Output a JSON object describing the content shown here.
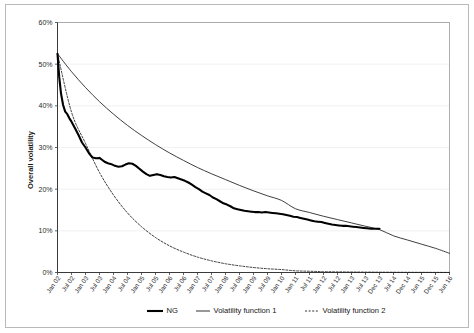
{
  "chart_data": {
    "type": "line",
    "title": "",
    "xlabel": "",
    "ylabel": "Overall volatility",
    "ylim": [
      0,
      60
    ],
    "yticks": [
      "0%",
      "10%",
      "20%",
      "30%",
      "40%",
      "50%",
      "60%"
    ],
    "ytick_values": [
      0,
      10,
      20,
      30,
      40,
      50,
      60
    ],
    "grid": true,
    "legend_position": "bottom",
    "categories": [
      "Jan 02",
      "Jul 02",
      "Jan 03",
      "Jul 03",
      "Jan 04",
      "Jul 04",
      "Jan 05",
      "Jul 05",
      "Jan 06",
      "Jul 06",
      "Jan 07",
      "Jul 07",
      "Jan 08",
      "Jul 08",
      "Jan 09",
      "Jul 09",
      "Jan 10",
      "Jan 11",
      "Jul 11",
      "Jan 12",
      "Jul 12",
      "Jan 13",
      "Jul 13",
      "Dec 13",
      "Jul 14",
      "Dec 14",
      "Jun 15",
      "Dec 15",
      "Jun 16"
    ],
    "series": [
      {
        "name": "NG",
        "style": "thick-solid",
        "color": "#000000",
        "values": [
          52.5,
          38.0,
          33.0,
          27.5,
          26.3,
          25.5,
          26.2,
          25.0,
          23.2,
          23.6,
          23.0,
          22.3,
          21.1,
          19.4,
          18.0,
          16.6,
          15.4,
          14.6,
          14.4,
          14.3,
          14.0,
          13.4,
          12.9,
          12.3,
          11.9,
          11.4,
          11.2,
          10.9,
          10.5
        ]
      },
      {
        "name": "Volatility function 1",
        "style": "thin-solid",
        "color": "#1c1c1c",
        "values": [
          52.5,
          48.2,
          44.4,
          41.0,
          38.0,
          35.3,
          32.9,
          30.7,
          28.7,
          26.9,
          25.2,
          23.7,
          22.3,
          20.9,
          19.6,
          18.4,
          17.3,
          15.3,
          14.4,
          13.5,
          12.7,
          11.9,
          11.1,
          10.3,
          8.8,
          7.8,
          6.8,
          5.8,
          4.6
        ]
      },
      {
        "name": "Volatility function 2",
        "style": "dotted",
        "color": "#1c1c1c",
        "values": [
          52.5,
          38.5,
          31.0,
          24.0,
          18.6,
          14.3,
          11.0,
          8.4,
          6.4,
          4.9,
          3.7,
          2.8,
          2.1,
          1.6,
          1.2,
          0.9,
          0.7,
          0.4,
          0.3,
          0.2,
          0.15,
          0.12,
          0.1,
          0.08,
          0.06,
          0.05,
          0.04,
          0.03,
          0.02
        ]
      }
    ],
    "ng_detail": [
      [
        0.0,
        52.5
      ],
      [
        0.12,
        47.0
      ],
      [
        0.25,
        43.0
      ],
      [
        0.4,
        40.2
      ],
      [
        0.55,
        38.6
      ],
      [
        0.7,
        38.0
      ],
      [
        0.85,
        37.0
      ],
      [
        1.0,
        36.2
      ],
      [
        1.25,
        34.6
      ],
      [
        1.5,
        33.0
      ],
      [
        1.75,
        31.2
      ],
      [
        2.0,
        30.0
      ],
      [
        2.25,
        28.6
      ],
      [
        2.5,
        27.6
      ],
      [
        2.75,
        27.4
      ],
      [
        3.0,
        27.5
      ],
      [
        3.2,
        27.0
      ],
      [
        3.4,
        26.5
      ],
      [
        3.6,
        26.2
      ],
      [
        3.85,
        26.0
      ],
      [
        4.1,
        25.6
      ],
      [
        4.35,
        25.4
      ],
      [
        4.6,
        25.5
      ],
      [
        4.85,
        25.9
      ],
      [
        5.1,
        26.2
      ],
      [
        5.35,
        26.1
      ],
      [
        5.6,
        25.6
      ],
      [
        5.85,
        24.9
      ],
      [
        6.1,
        24.2
      ],
      [
        6.35,
        23.6
      ],
      [
        6.6,
        23.2
      ],
      [
        6.85,
        23.4
      ],
      [
        7.1,
        23.6
      ],
      [
        7.35,
        23.4
      ],
      [
        7.6,
        23.1
      ],
      [
        7.85,
        22.9
      ],
      [
        8.1,
        22.8
      ],
      [
        8.35,
        22.9
      ],
      [
        8.6,
        22.6
      ],
      [
        8.85,
        22.3
      ],
      [
        9.1,
        22.0
      ],
      [
        9.35,
        21.6
      ],
      [
        9.6,
        21.1
      ],
      [
        9.85,
        20.5
      ],
      [
        10.1,
        20.0
      ],
      [
        10.35,
        19.4
      ],
      [
        10.6,
        19.0
      ],
      [
        10.85,
        18.6
      ],
      [
        11.1,
        18.0
      ],
      [
        11.35,
        17.6
      ],
      [
        11.6,
        17.1
      ],
      [
        11.85,
        16.6
      ],
      [
        12.1,
        16.3
      ],
      [
        12.35,
        15.9
      ],
      [
        12.6,
        15.4
      ],
      [
        12.85,
        15.2
      ],
      [
        13.1,
        15.0
      ],
      [
        13.35,
        14.8
      ],
      [
        13.6,
        14.7
      ],
      [
        13.85,
        14.6
      ],
      [
        14.1,
        14.5
      ],
      [
        14.35,
        14.5
      ],
      [
        14.6,
        14.4
      ],
      [
        14.85,
        14.5
      ],
      [
        15.1,
        14.4
      ],
      [
        15.35,
        14.3
      ],
      [
        15.6,
        14.2
      ],
      [
        15.85,
        14.1
      ],
      [
        16.1,
        14.0
      ],
      [
        16.35,
        13.8
      ],
      [
        16.6,
        13.6
      ],
      [
        16.85,
        13.4
      ],
      [
        17.1,
        13.3
      ],
      [
        17.35,
        13.1
      ],
      [
        17.6,
        12.9
      ],
      [
        17.85,
        12.7
      ],
      [
        18.1,
        12.5
      ],
      [
        18.35,
        12.3
      ],
      [
        18.6,
        12.2
      ],
      [
        18.85,
        12.1
      ],
      [
        19.1,
        11.9
      ],
      [
        19.35,
        11.7
      ],
      [
        19.6,
        11.5
      ],
      [
        19.85,
        11.4
      ],
      [
        20.1,
        11.3
      ],
      [
        20.35,
        11.2
      ],
      [
        20.6,
        11.2
      ],
      [
        20.85,
        11.1
      ],
      [
        21.1,
        11.0
      ],
      [
        21.35,
        10.9
      ],
      [
        21.6,
        10.8
      ],
      [
        21.85,
        10.7
      ],
      [
        22.1,
        10.6
      ],
      [
        22.4,
        10.5
      ],
      [
        22.7,
        10.5
      ],
      [
        23.0,
        10.5
      ]
    ],
    "annotations": []
  },
  "legend": {
    "items": [
      {
        "label": "NG",
        "style": "thick-solid"
      },
      {
        "label": "Volatility function 1",
        "style": "thin-solid"
      },
      {
        "label": "Volatility function 2",
        "style": "dotted"
      }
    ]
  },
  "colors": {
    "background": "#ffffff",
    "frame": "#b9b9b9",
    "grid": "#e8e8e8",
    "axis": "#3a3a3a",
    "series": "#000000"
  }
}
